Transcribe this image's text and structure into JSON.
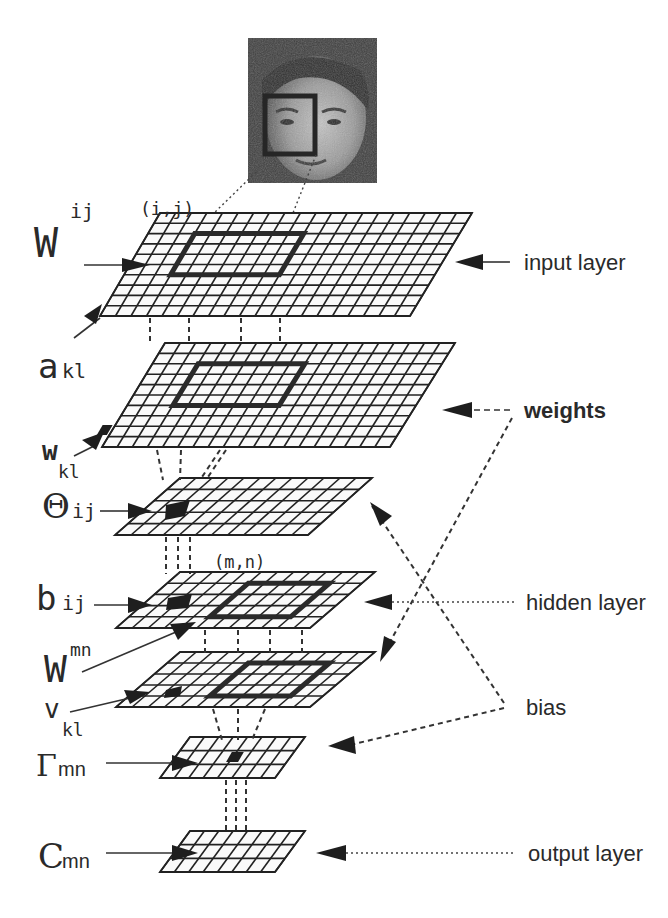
{
  "figure": {
    "photo": {
      "subject": "face-photo",
      "x": 248,
      "y": 38,
      "w": 129,
      "h": 145,
      "window": {
        "x": 265,
        "y": 96,
        "w": 50,
        "h": 58
      }
    }
  },
  "layers": [
    {
      "id": "input",
      "tl": [
        160,
        213
      ],
      "tr": [
        472,
        213
      ],
      "bl": [
        100,
        316
      ],
      "br": [
        410,
        316
      ],
      "cols": 20,
      "rows": 10,
      "rf": {
        "c0": 3,
        "c1": 10,
        "r0": 2,
        "r1": 6
      }
    },
    {
      "id": "a",
      "tl": [
        165,
        343
      ],
      "tr": [
        455,
        343
      ],
      "bl": [
        102,
        447
      ],
      "br": [
        390,
        447
      ],
      "cols": 19,
      "rows": 10,
      "rf": {
        "c0": 3,
        "c1": 10,
        "r0": 2,
        "r1": 6
      }
    },
    {
      "id": "theta",
      "tl": [
        180,
        478
      ],
      "tr": [
        372,
        478
      ],
      "bl": [
        115,
        535
      ],
      "br": [
        308,
        535
      ],
      "cols": 12,
      "rows": 5,
      "rf": null
    },
    {
      "id": "b",
      "tl": [
        180,
        572
      ],
      "tr": [
        375,
        572
      ],
      "bl": [
        116,
        628
      ],
      "br": [
        310,
        628
      ],
      "cols": 12,
      "rows": 5,
      "rf": {
        "c0": 5,
        "c1": 10,
        "r0": 1,
        "r1": 4
      }
    },
    {
      "id": "v",
      "tl": [
        180,
        652
      ],
      "tr": [
        375,
        652
      ],
      "bl": [
        116,
        707
      ],
      "br": [
        310,
        707
      ],
      "cols": 12,
      "rows": 5,
      "rf": {
        "c0": 5,
        "c1": 10,
        "r0": 1,
        "r1": 4
      }
    },
    {
      "id": "gamma",
      "tl": [
        190,
        737
      ],
      "tr": [
        305,
        737
      ],
      "bl": [
        160,
        778
      ],
      "br": [
        275,
        778
      ],
      "cols": 8,
      "rows": 3,
      "rf": null
    },
    {
      "id": "c",
      "tl": [
        190,
        831
      ],
      "tr": [
        305,
        831
      ],
      "bl": [
        160,
        872
      ],
      "br": [
        275,
        872
      ],
      "cols": 8,
      "rows": 3,
      "rf": null
    }
  ],
  "left_labels": {
    "W_ij": {
      "base": "W",
      "sup": "ij"
    },
    "ij_coord": "(i,j)",
    "a_kl": {
      "base": "a",
      "sub": "kl"
    },
    "w_kl": {
      "base": "w",
      "sub": "kl"
    },
    "theta_ij": {
      "base": "Θ",
      "sub": "ij"
    },
    "mn_coord": "(m,n)",
    "b_ij": {
      "base": "b",
      "sub": "ij"
    },
    "W_mn": {
      "base": "W",
      "sup": "mn"
    },
    "v_kl": {
      "base": "v",
      "sub": "kl"
    },
    "gamma_mn": {
      "base": "Γ",
      "sub": "mn"
    },
    "c_mn": {
      "base": "C",
      "sub": "mn"
    }
  },
  "right_labels": {
    "input_layer": "input layer",
    "weights": "weights",
    "hidden_layer": "hidden layer",
    "bias": "bias",
    "output_layer": "output layer"
  },
  "colors": {
    "ink": "#222222",
    "paper": "#ffffff",
    "photo_dark": "#3a3a3a",
    "photo_light": "#b8b8b8"
  }
}
